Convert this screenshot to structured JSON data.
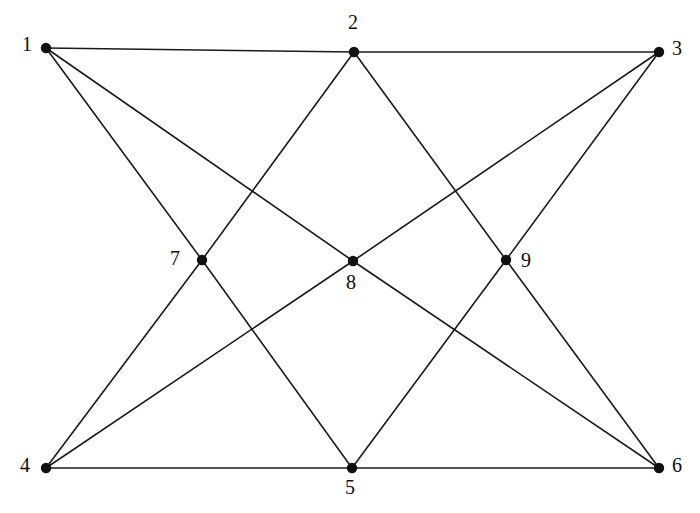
{
  "figure": {
    "title": "",
    "background_color": "#ffffff",
    "edge_color": "#1a1a1a",
    "vertex_color": "#111111",
    "width": 700,
    "height": 513
  },
  "chart_data": {
    "type": "diagram",
    "graph_type": "undirected-graph",
    "title": "",
    "vertex_count": 9,
    "edge_count": 16,
    "vertices": [
      {
        "id": "1",
        "label": "1",
        "x": 46,
        "y": 48,
        "label_x": 22,
        "label_y": 34,
        "degree": 3
      },
      {
        "id": "2",
        "label": "2",
        "x": 354,
        "y": 52,
        "label_x": 348,
        "label_y": 12,
        "degree": 4
      },
      {
        "id": "3",
        "label": "3",
        "x": 659,
        "y": 52,
        "label_x": 672,
        "label_y": 38,
        "degree": 3
      },
      {
        "id": "4",
        "label": "4",
        "x": 46,
        "y": 468,
        "label_x": 20,
        "label_y": 455,
        "degree": 3
      },
      {
        "id": "5",
        "label": "5",
        "x": 352,
        "y": 468,
        "label_x": 345,
        "label_y": 477,
        "degree": 4
      },
      {
        "id": "6",
        "label": "6",
        "x": 659,
        "y": 468,
        "label_x": 672,
        "label_y": 455,
        "degree": 3
      },
      {
        "id": "7",
        "label": "7",
        "x": 202,
        "y": 260,
        "label_x": 170,
        "label_y": 248,
        "degree": 4
      },
      {
        "id": "8",
        "label": "8",
        "x": 353,
        "y": 261,
        "label_x": 346,
        "label_y": 272,
        "degree": 4
      },
      {
        "id": "9",
        "label": "9",
        "x": 506,
        "y": 260,
        "label_x": 521,
        "label_y": 250,
        "degree": 4
      }
    ],
    "edges": [
      {
        "from": "1",
        "to": "2"
      },
      {
        "from": "2",
        "to": "3"
      },
      {
        "from": "1",
        "to": "7"
      },
      {
        "from": "1",
        "to": "8"
      },
      {
        "from": "2",
        "to": "7"
      },
      {
        "from": "2",
        "to": "9"
      },
      {
        "from": "3",
        "to": "8"
      },
      {
        "from": "3",
        "to": "9"
      },
      {
        "from": "4",
        "to": "5"
      },
      {
        "from": "5",
        "to": "6"
      },
      {
        "from": "4",
        "to": "7"
      },
      {
        "from": "4",
        "to": "8"
      },
      {
        "from": "5",
        "to": "7"
      },
      {
        "from": "5",
        "to": "9"
      },
      {
        "from": "6",
        "to": "8"
      },
      {
        "from": "6",
        "to": "9"
      }
    ],
    "vertex_radius": 5.2,
    "edge_width": 1.6
  }
}
